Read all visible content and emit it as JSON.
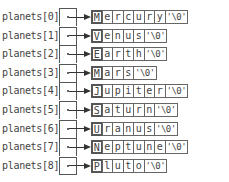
{
  "diagram": {
    "title": "",
    "array_name": "planets",
    "rows": [
      {
        "label": "planets[0]",
        "chars": [
          "M",
          "e",
          "r",
          "c",
          "u",
          "r",
          "y",
          "'\\0'"
        ]
      },
      {
        "label": "planets[1]",
        "chars": [
          "V",
          "e",
          "n",
          "u",
          "s",
          "'\\0'"
        ]
      },
      {
        "label": "planets[2]",
        "chars": [
          "E",
          "a",
          "r",
          "t",
          "h",
          "'\\0'"
        ]
      },
      {
        "label": "planets[3]",
        "chars": [
          "M",
          "a",
          "r",
          "s",
          "'\\0'"
        ]
      },
      {
        "label": "planets[4]",
        "chars": [
          "J",
          "u",
          "p",
          "i",
          "t",
          "e",
          "r",
          "'\\0'"
        ]
      },
      {
        "label": "planets[5]",
        "chars": [
          "S",
          "a",
          "t",
          "u",
          "r",
          "n",
          "'\\0'"
        ]
      },
      {
        "label": "planets[6]",
        "chars": [
          "U",
          "r",
          "a",
          "n",
          "u",
          "s",
          "'\\0'"
        ]
      },
      {
        "label": "planets[7]",
        "chars": [
          "N",
          "e",
          "p",
          "t",
          "u",
          "n",
          "e",
          "'\\0'"
        ]
      },
      {
        "label": "planets[8]",
        "chars": [
          "P",
          "l",
          "u",
          "t",
          "o",
          "'\\0'"
        ]
      }
    ]
  }
}
